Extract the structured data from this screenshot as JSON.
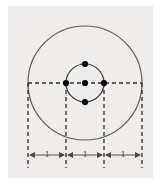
{
  "figure": {
    "background_color": "#eeedeb",
    "page_color": "#ffffff",
    "stroke_color": "#5a5a5a",
    "dash_color": "#2b2b2b",
    "dot_color": "#000000",
    "label_color": "#3a3a3a",
    "outer_circle": {
      "name": "outer-circle",
      "cx": 85,
      "cy": 83,
      "r": 57
    },
    "inner_circle": {
      "name": "inner-circle",
      "cx": 85,
      "cy": 83,
      "r": 19
    },
    "dots": [
      {
        "name": "dot-center",
        "cx": 85,
        "cy": 83
      },
      {
        "name": "dot-left",
        "cx": 66,
        "cy": 83
      },
      {
        "name": "dot-right",
        "cx": 104,
        "cy": 83
      },
      {
        "name": "dot-top",
        "cx": 85,
        "cy": 64
      },
      {
        "name": "dot-bottom",
        "cx": 85,
        "cy": 102
      }
    ],
    "horizontal_axis": {
      "name": "horizontal-dashed-axis",
      "x1": 28,
      "x2": 142,
      "y": 83
    },
    "vertical_lines": [
      {
        "name": "vertical-dashed-line-1",
        "x": 28,
        "y1": 83,
        "y2": 168
      },
      {
        "name": "vertical-dashed-line-2",
        "x": 66,
        "y1": 83,
        "y2": 168
      },
      {
        "name": "vertical-dashed-line-3",
        "x": 104,
        "y1": 83,
        "y2": 168
      },
      {
        "name": "vertical-dashed-line-4",
        "x": 142,
        "y1": 83,
        "y2": 168
      }
    ],
    "dimensions": [
      {
        "name": "dimension-segment-left",
        "label": "1",
        "x1": 28,
        "x2": 66,
        "y": 155
      },
      {
        "name": "dimension-segment-middle",
        "label": "1",
        "x1": 66,
        "x2": 104,
        "y": 155
      },
      {
        "name": "dimension-segment-right",
        "label": "1",
        "x1": 104,
        "x2": 142,
        "y": 155
      }
    ]
  }
}
